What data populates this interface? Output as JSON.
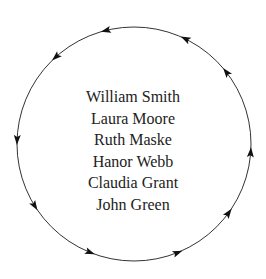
{
  "diagram": {
    "type": "cycle",
    "direction": "counter-clockwise",
    "circle": {
      "cx": 134,
      "cy": 144,
      "r": 117,
      "stroke": "#333333"
    },
    "arrow_count": 10,
    "names": [
      "William Smith",
      "Laura Moore",
      "Ruth Maske",
      "Hanor Webb",
      "Claudia Grant",
      "John Green"
    ]
  }
}
